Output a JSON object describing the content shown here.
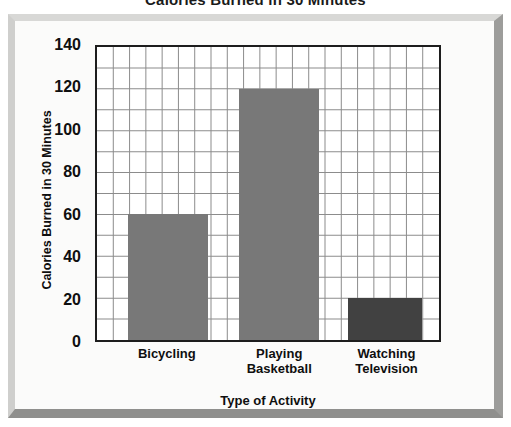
{
  "chart_data": {
    "type": "bar",
    "title": "Calories Burned in 30 Minutes",
    "xlabel": "Type of Activity",
    "ylabel": "Calories Burned in 30 Minutes",
    "categories": [
      "Bicycling",
      "Playing Basketball",
      "Watching Television"
    ],
    "category_lines": [
      [
        "Bicycling"
      ],
      [
        "Playing",
        "Basketball"
      ],
      [
        "Watching",
        "Television"
      ]
    ],
    "values": [
      60,
      120,
      20
    ],
    "ylim": [
      0,
      140
    ],
    "ytick_labels": [
      "0",
      "20",
      "40",
      "60",
      "80",
      "100",
      "120",
      "140"
    ],
    "ytick_values": [
      0,
      20,
      40,
      60,
      80,
      100,
      120,
      140
    ],
    "y_minor_step": 10,
    "grid": true,
    "grid_columns": 21,
    "legend": "none",
    "bar_colors": [
      "#787878",
      "#787878",
      "#414141"
    ],
    "bar_positions_pct": [
      {
        "left": 9.0,
        "width": 23.5
      },
      {
        "left": 41.5,
        "width": 23.5
      },
      {
        "left": 73.5,
        "width": 21.5
      }
    ],
    "colors": {
      "bar_light": "#787878",
      "bar_dark": "#414141",
      "plot_border": "#1d1d1d",
      "grid_line": "#8c8c8c",
      "frame_light": "#d8d8d6",
      "frame_shadow": "#8f8f8d",
      "background": "#fbfbfa",
      "text": "#0f0f0f"
    }
  }
}
